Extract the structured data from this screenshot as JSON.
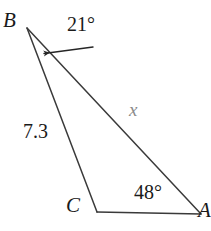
{
  "figure": {
    "kind": "triangle-diagram",
    "background_color": "#ffffff",
    "stroke_color": "#3a3a3a",
    "unknown_color": "#8a8a8a",
    "vertices": {
      "B": {
        "label": "B",
        "x": 27,
        "y": 28
      },
      "C": {
        "label": "C",
        "x": 97,
        "y": 212
      },
      "A": {
        "label": "A",
        "x": 201,
        "y": 214
      }
    },
    "sides": [
      {
        "name": "BC",
        "from": "B",
        "to": "C",
        "label": "7.3",
        "is_unknown": false
      },
      {
        "name": "BA",
        "from": "B",
        "to": "A",
        "label": "x",
        "is_unknown": true
      },
      {
        "name": "CA",
        "from": "C",
        "to": "A",
        "label": "",
        "is_unknown": false
      }
    ],
    "angles": [
      {
        "at": "B",
        "label": "21°",
        "value": 21,
        "marker": "arrow-leader"
      },
      {
        "at": "A",
        "label": "48°",
        "value": 48,
        "marker": "none"
      }
    ],
    "leader": {
      "name": "angle-b-leader",
      "from_x": 93,
      "from_y": 47,
      "to_x": 40,
      "to_y": 54,
      "arrowhead": "filled-triangle"
    }
  }
}
